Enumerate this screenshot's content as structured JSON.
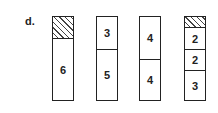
{
  "label": "d.",
  "bars": [
    {
      "segments": [
        {
          "type": "hatch",
          "value": "",
          "units": 2
        },
        {
          "type": "number",
          "value": "6",
          "units": 6
        }
      ]
    },
    {
      "segments": [
        {
          "type": "number",
          "value": "3",
          "units": 3
        },
        {
          "type": "number",
          "value": "5",
          "units": 5
        }
      ]
    },
    {
      "segments": [
        {
          "type": "number",
          "value": "4",
          "units": 4
        },
        {
          "type": "number",
          "value": "4",
          "units": 4
        }
      ]
    },
    {
      "segments": [
        {
          "type": "hatch",
          "value": "",
          "units": 1
        },
        {
          "type": "number",
          "value": "2",
          "units": 2
        },
        {
          "type": "number",
          "value": "2",
          "units": 2
        },
        {
          "type": "number",
          "value": "3",
          "units": 3
        }
      ]
    }
  ]
}
